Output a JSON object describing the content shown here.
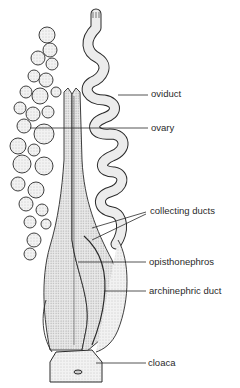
{
  "figure": {
    "labels": {
      "oviduct": "oviduct",
      "ovary": "ovary",
      "collecting_ducts": "collecting ducts",
      "opisthonephros": "opisthonephros",
      "archinephric_duct": "archinephric duct",
      "cloaca": "cloaca"
    },
    "colors": {
      "ink": "#2a2a2a",
      "stipple": "#e4e4e4",
      "background": "#ffffff"
    }
  }
}
